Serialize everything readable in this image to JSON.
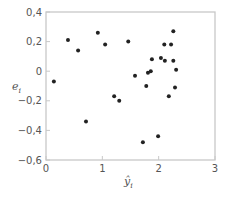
{
  "chart_data": {
    "type": "scatter",
    "title": "",
    "xlabel": "ŷ",
    "xlabel_sub": "i",
    "ylabel": "e",
    "ylabel_sub": "i",
    "xlim": [
      0,
      3
    ],
    "ylim": [
      -0.6,
      0.4
    ],
    "x_ticks": [
      0,
      1,
      2,
      3
    ],
    "x_tick_labels": [
      "0",
      "1",
      "2",
      "3"
    ],
    "y_ticks": [
      0.4,
      0.2,
      0,
      -0.2,
      -0.4,
      -0.6
    ],
    "y_tick_labels": [
      "0,4",
      "0,2",
      "0",
      "−0,2",
      "−0,4",
      "−0,6"
    ],
    "grid": false,
    "frame_color": "#c8c8c8",
    "point_color": "#222222",
    "series": [
      {
        "name": "residuals",
        "points": [
          [
            0.14,
            -0.07
          ],
          [
            0.39,
            0.21
          ],
          [
            0.57,
            0.14
          ],
          [
            0.92,
            0.26
          ],
          [
            1.05,
            0.18
          ],
          [
            0.71,
            -0.34
          ],
          [
            1.21,
            -0.17
          ],
          [
            1.3,
            -0.2
          ],
          [
            1.46,
            0.2
          ],
          [
            1.58,
            -0.03
          ],
          [
            1.72,
            -0.48
          ],
          [
            1.78,
            -0.1
          ],
          [
            1.81,
            -0.01
          ],
          [
            1.86,
            0.0
          ],
          [
            1.88,
            0.08
          ],
          [
            1.99,
            -0.44
          ],
          [
            2.04,
            0.09
          ],
          [
            2.1,
            0.18
          ],
          [
            2.11,
            0.07
          ],
          [
            2.18,
            -0.17
          ],
          [
            2.22,
            0.18
          ],
          [
            2.26,
            0.27
          ],
          [
            2.26,
            0.07
          ],
          [
            2.29,
            -0.11
          ],
          [
            2.31,
            0.01
          ]
        ]
      }
    ]
  }
}
